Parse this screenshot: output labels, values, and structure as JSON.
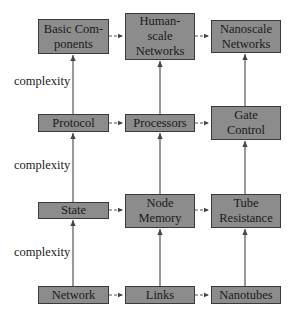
{
  "diagram": {
    "columns": [
      {
        "name": "abstract",
        "nodes": [
          "Basic Com-\nponents",
          "Protocol",
          "State",
          "Network"
        ]
      },
      {
        "name": "human-scale",
        "nodes": [
          "Human-\nscale\nNetworks",
          "Processors",
          "Node\nMemory",
          "Links"
        ]
      },
      {
        "name": "nanoscale",
        "nodes": [
          "Nanoscale\nNetworks",
          "Gate\nControl",
          "Tube\nResistance",
          "Nanotubes"
        ]
      }
    ],
    "axis_labels": [
      "complexity",
      "complexity",
      "complexity"
    ],
    "edges": {
      "vertical_solid": "bottom-to-top arrows within each column",
      "horizontal_dashed": "left-to-right dashed arrows between columns in each row"
    },
    "colors": {
      "box_fill": "#8c8c8c",
      "box_border": "#3a3a3a",
      "arrow": "#444444"
    }
  }
}
